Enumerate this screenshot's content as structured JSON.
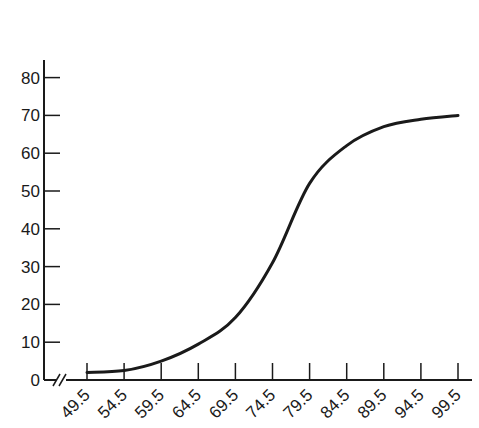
{
  "chart_data": {
    "type": "line",
    "title": "",
    "xlabel": "",
    "ylabel": "",
    "x": [
      49.5,
      54.5,
      59.5,
      64.5,
      69.5,
      74.5,
      79.5,
      84.5,
      89.5,
      94.5,
      99.5
    ],
    "x_tick_labels": [
      "49.5",
      "54.5",
      "59.5",
      "64.5",
      "69.5",
      "74.5",
      "79.5",
      "84.5",
      "89.5",
      "94.5",
      "99.5"
    ],
    "series": [
      {
        "name": "cumulative frequency",
        "values": [
          2,
          2.5,
          5,
          9.5,
          16.5,
          31,
          52,
          62,
          67,
          69,
          70
        ]
      }
    ],
    "y_ticks": [
      0,
      10,
      20,
      30,
      40,
      50,
      60,
      70,
      80
    ],
    "y_tick_labels": [
      "0",
      "10",
      "20",
      "30",
      "40",
      "50",
      "60",
      "70",
      "80"
    ],
    "ylim": [
      0,
      85
    ],
    "xlim": [
      49.5,
      99.5
    ],
    "x_axis_break": true,
    "grid": false,
    "legend": "none",
    "colors": {
      "line": "#1a1a1a",
      "axis": "#1a1a1a",
      "background": "#ffffff"
    }
  }
}
